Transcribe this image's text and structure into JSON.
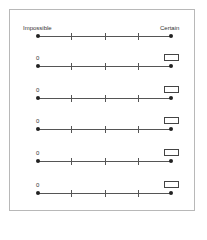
{
  "scale": {
    "left_label": "Impossible",
    "right_label": "Certain"
  },
  "rows": [
    {
      "start_label": "0",
      "answer_box": ""
    },
    {
      "start_label": "0",
      "answer_box": ""
    },
    {
      "start_label": "0",
      "answer_box": ""
    },
    {
      "start_label": "0",
      "answer_box": ""
    },
    {
      "start_label": "0",
      "answer_box": ""
    }
  ],
  "tick_count": 5
}
